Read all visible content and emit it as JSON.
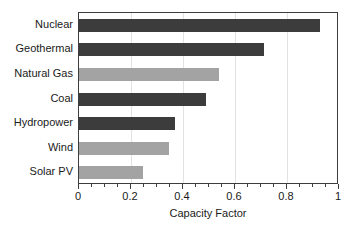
{
  "chart_data": {
    "type": "bar",
    "orientation": "horizontal",
    "title": "",
    "xlabel": "Capacity Factor",
    "ylabel": "",
    "xlim": [
      0,
      1
    ],
    "xticks": [
      0,
      0.2,
      0.4,
      0.6,
      0.8,
      1
    ],
    "xticklabels": [
      "0",
      "0.2",
      "0.4",
      "0.6",
      "0.8",
      "1"
    ],
    "minor_tick_step": 0.05,
    "grid": "vertical-light",
    "legend": "none",
    "categories": [
      "Nuclear",
      "Geothermal",
      "Natural Gas",
      "Coal",
      "Hydropower",
      "Wind",
      "Solar PV"
    ],
    "values": [
      0.925,
      0.71,
      0.54,
      0.49,
      0.37,
      0.345,
      0.245
    ],
    "bar_colors": [
      "#3c3c3c",
      "#3c3c3c",
      "#a3a3a3",
      "#3c3c3c",
      "#3c3c3c",
      "#a3a3a3",
      "#a3a3a3"
    ],
    "colors": {
      "dark_bar": "#3c3c3c",
      "light_bar": "#a3a3a3",
      "axis": "#3d3d3d",
      "gridline": "#e2e2e2",
      "text": "#1a1a1a",
      "background": "#ffffff"
    },
    "bars": [
      {
        "label": "Nuclear",
        "value": 0.925,
        "color": "#3c3c3c"
      },
      {
        "label": "Geothermal",
        "value": 0.71,
        "color": "#3c3c3c"
      },
      {
        "label": "Natural Gas",
        "value": 0.54,
        "color": "#a3a3a3"
      },
      {
        "label": "Coal",
        "value": 0.49,
        "color": "#3c3c3c"
      },
      {
        "label": "Hydropower",
        "value": 0.37,
        "color": "#3c3c3c"
      },
      {
        "label": "Wind",
        "value": 0.345,
        "color": "#a3a3a3"
      },
      {
        "label": "Solar PV",
        "value": 0.245,
        "color": "#a3a3a3"
      }
    ]
  }
}
